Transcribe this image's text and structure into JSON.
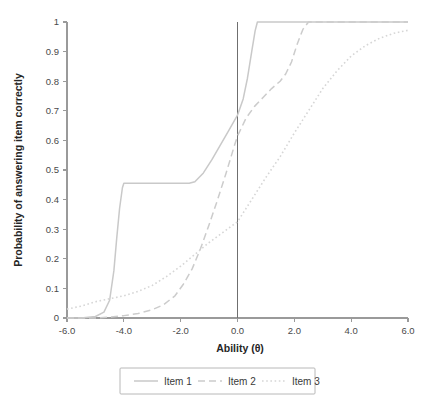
{
  "chart_data": {
    "type": "line",
    "title": "",
    "xlabel": "Ability (θ)",
    "ylabel": "Probability of answering item correctly",
    "xlim": [
      -6.0,
      6.0
    ],
    "ylim": [
      0,
      1
    ],
    "grid": false,
    "legend_position": "bottom",
    "xticks": [
      -6.0,
      -4.0,
      -2.0,
      0.0,
      2.0,
      4.0,
      6.0
    ],
    "xtick_labels": [
      "-6.0",
      "-4.0",
      "-2.0",
      "0.0",
      "2.0",
      "4.0",
      "6.0"
    ],
    "yticks": [
      0,
      0.1,
      0.2,
      0.3,
      0.4,
      0.5,
      0.6,
      0.7,
      0.8,
      0.9,
      1
    ],
    "ytick_labels": [
      "0",
      "0.1",
      "0.2",
      "0.3",
      "0.4",
      "0.5",
      "0.6",
      "0.7",
      "0.8",
      "0.9",
      "1"
    ],
    "annotations": [
      {
        "name": "reference-line-theta-zero",
        "type": "vline",
        "x": 0.0,
        "color": "#6f6f6f"
      }
    ],
    "series": [
      {
        "name": "Item 1",
        "style": "solid",
        "color": "#c9c9c9",
        "x": [
          -6.0,
          -5.5,
          -5.0,
          -4.7,
          -4.5,
          -4.35,
          -4.25,
          -4.15,
          -4.05,
          -4.0,
          -3.5,
          -3.0,
          -2.5,
          -2.0,
          -1.7,
          -1.5,
          -1.2,
          -0.9,
          -0.6,
          -0.3,
          0.0,
          0.2,
          0.35,
          0.5,
          0.62,
          0.7,
          1.0,
          2.0,
          3.0,
          4.0,
          5.0,
          6.0
        ],
        "y": [
          0.0,
          0.0,
          0.005,
          0.02,
          0.06,
          0.16,
          0.27,
          0.37,
          0.44,
          0.455,
          0.455,
          0.455,
          0.455,
          0.455,
          0.455,
          0.46,
          0.49,
          0.535,
          0.585,
          0.635,
          0.685,
          0.74,
          0.81,
          0.9,
          0.97,
          1.0,
          1.0,
          1.0,
          1.0,
          1.0,
          1.0,
          1.0
        ]
      },
      {
        "name": "Item 2",
        "style": "dashed",
        "color": "#cccccc",
        "x": [
          -6.0,
          -5.5,
          -5.0,
          -4.5,
          -4.0,
          -3.5,
          -3.0,
          -2.6,
          -2.2,
          -1.9,
          -1.6,
          -1.3,
          -1.0,
          -0.7,
          -0.4,
          -0.1,
          0.0,
          0.3,
          0.6,
          0.9,
          1.2,
          1.5,
          1.7,
          1.9,
          2.1,
          2.3,
          2.5,
          3.0,
          4.0,
          5.0,
          6.0
        ],
        "y": [
          0.0,
          0.0,
          0.0,
          0.003,
          0.008,
          0.015,
          0.028,
          0.045,
          0.075,
          0.115,
          0.165,
          0.235,
          0.315,
          0.4,
          0.49,
          0.585,
          0.615,
          0.675,
          0.715,
          0.745,
          0.775,
          0.8,
          0.825,
          0.865,
          0.925,
          0.975,
          1.0,
          1.0,
          1.0,
          1.0,
          1.0
        ]
      },
      {
        "name": "Item 3",
        "style": "dotted",
        "color": "#d6d6d6",
        "x": [
          -6.0,
          -5.5,
          -5.0,
          -4.5,
          -4.0,
          -3.5,
          -3.0,
          -2.5,
          -2.0,
          -1.5,
          -1.0,
          -0.5,
          0.0,
          0.5,
          1.0,
          1.5,
          2.0,
          2.5,
          3.0,
          3.5,
          4.0,
          4.5,
          5.0,
          5.5,
          6.0
        ],
        "y": [
          0.03,
          0.04,
          0.055,
          0.065,
          0.075,
          0.09,
          0.11,
          0.14,
          0.175,
          0.215,
          0.255,
          0.29,
          0.325,
          0.4,
          0.475,
          0.545,
          0.625,
          0.7,
          0.775,
          0.835,
          0.885,
          0.92,
          0.945,
          0.962,
          0.972
        ]
      }
    ]
  },
  "legend": {
    "items": [
      {
        "label": "Item 1"
      },
      {
        "label": "Item 2"
      },
      {
        "label": "Item 3"
      }
    ]
  }
}
